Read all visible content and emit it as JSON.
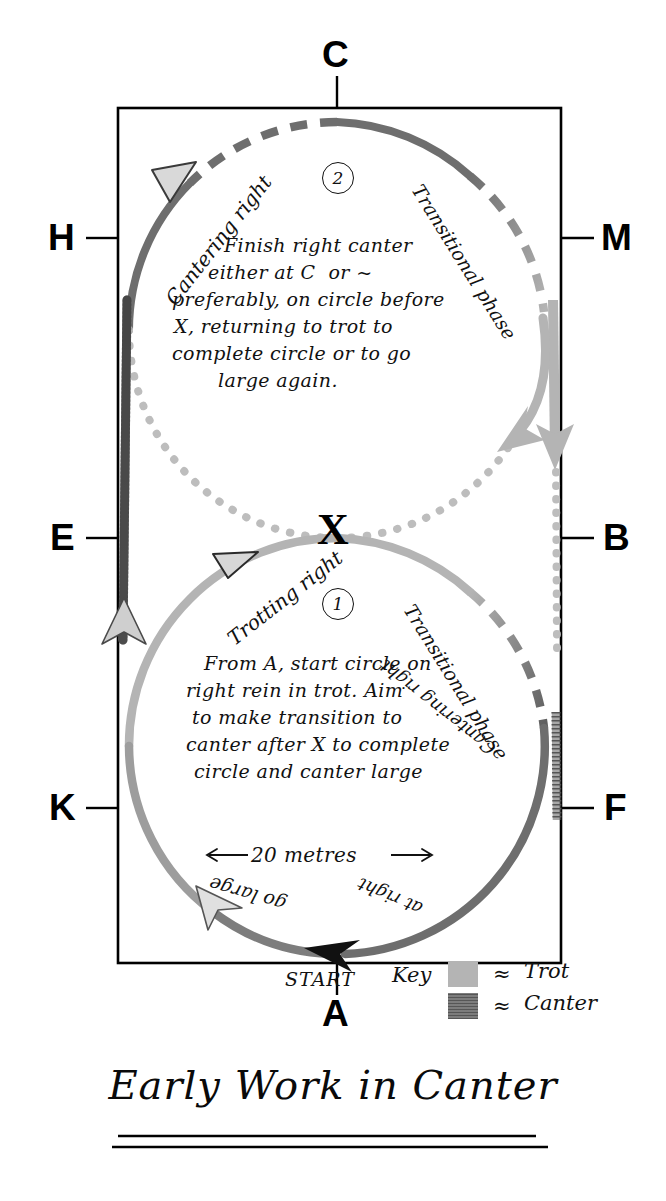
{
  "title": {
    "text": "Early Work in Canter"
  },
  "arena": {
    "markers": [
      {
        "label": "C",
        "position": "top-center"
      },
      {
        "label": "H",
        "position": "left-upper"
      },
      {
        "label": "M",
        "position": "right-upper"
      },
      {
        "label": "E",
        "position": "left-middle"
      },
      {
        "label": "B",
        "position": "right-middle"
      },
      {
        "label": "K",
        "position": "left-lower"
      },
      {
        "label": "F",
        "position": "right-lower"
      },
      {
        "label": "A",
        "position": "bottom-center"
      },
      {
        "label": "X",
        "position": "center"
      }
    ]
  },
  "figures": [
    {
      "number": "2",
      "name": "upper-circle",
      "path_labels": [
        {
          "text": "Cantering right",
          "side": "upper-left"
        },
        {
          "text": "Transitional phase",
          "side": "upper-right"
        }
      ],
      "note_lines": [
        "Finish right canter",
        "either at C  or ~",
        "preferably, on circle before",
        "X, returning to trot to",
        "complete circle or to go",
        "large again."
      ]
    },
    {
      "number": "1",
      "name": "lower-circle",
      "path_labels": [
        {
          "text": "Trotting right",
          "side": "upper-left"
        },
        {
          "text": "Transitional phase",
          "side": "lower-right"
        },
        {
          "text": "Cantering right",
          "side": "bottom-right"
        },
        {
          "text": "go large",
          "side": "bottom-left"
        },
        {
          "text": "at right",
          "side": "bottom-center-right"
        }
      ],
      "note_lines": [
        "From A, start circle on",
        "right rein in trot. Aim",
        "to make transition to",
        "canter after X to complete",
        "circle and canter large"
      ],
      "dimension": {
        "text": "20 metres",
        "left_arrow": "←",
        "right_arrow": "→"
      }
    }
  ],
  "start": {
    "label": "START"
  },
  "key": {
    "title": "Key",
    "items": [
      {
        "approx": "≈",
        "label": "Trot",
        "color": "#b4b4b4"
      },
      {
        "approx": "≈",
        "label": "Canter",
        "color": "#6e6e6e"
      }
    ]
  },
  "colors": {
    "trot": "#b4b4b4",
    "canter": "#6e6e6e",
    "dotted": "#bdbdbd",
    "ink": "#111111",
    "arena_border": "#000000"
  }
}
